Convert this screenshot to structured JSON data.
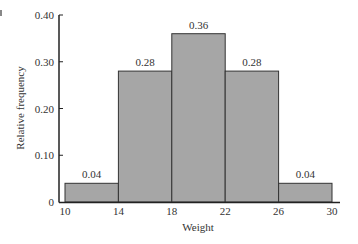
{
  "chart_data": {
    "type": "bar",
    "subtype": "histogram",
    "title": "",
    "xlabel": "Weight",
    "ylabel": "Relative frequency",
    "bin_edges": [
      10,
      14,
      18,
      22,
      26,
      30
    ],
    "categories": [
      "10-14",
      "14-18",
      "18-22",
      "22-26",
      "26-30"
    ],
    "values": [
      0.04,
      0.28,
      0.36,
      0.28,
      0.04
    ],
    "data_labels": [
      "0.04",
      "0.28",
      "0.36",
      "0.28",
      "0.04"
    ],
    "x_ticks": [
      "10",
      "14",
      "18",
      "22",
      "26",
      "30"
    ],
    "y_ticks": [
      "0",
      "0.10",
      "0.20",
      "0.30",
      "0.40"
    ],
    "ylim": [
      0,
      0.4
    ],
    "xlim": [
      10,
      30
    ],
    "grid": false,
    "legend": null,
    "bar_color": "#a6a6a6"
  }
}
